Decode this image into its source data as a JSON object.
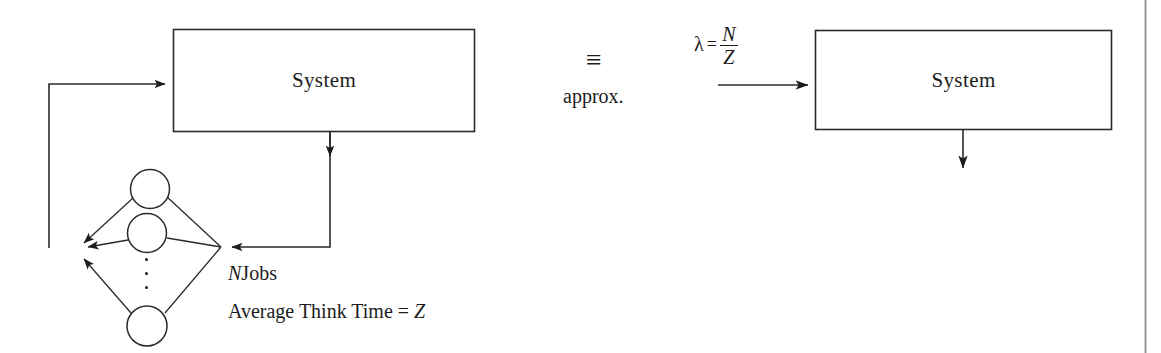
{
  "figure": {
    "background_color": "#ffffff",
    "stroke_color": "#1c1c1c",
    "width": 1161,
    "height": 353
  },
  "left_model": {
    "box_label": "System",
    "terminals_label_line1_var": "N",
    "terminals_label_line1_text": "Jobs",
    "terminals_label_line2": "Average Think Time = ",
    "terminals_label_line2_var": "Z",
    "terminal_count_shown": 3,
    "ellipsis": "⋮"
  },
  "equivalence": {
    "symbol": "≡",
    "caption": "approx."
  },
  "right_model": {
    "box_label": "System",
    "formula": {
      "lambda": "λ",
      "equals": "=",
      "numerator": "N",
      "denominator": "Z"
    }
  }
}
